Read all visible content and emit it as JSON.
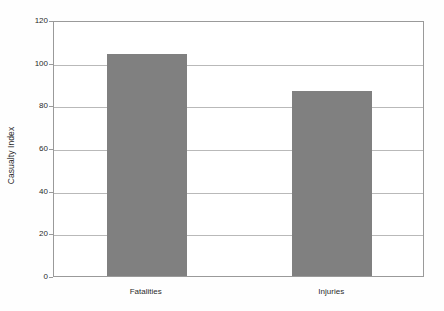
{
  "chart_data": {
    "type": "bar",
    "title": "",
    "subtitle": "",
    "xlabel": "",
    "ylabel": "Casualty Index",
    "categories": [
      "Fatalities",
      "Injuries"
    ],
    "values": [
      104,
      86.5
    ],
    "series": [
      {
        "name": "Casualty Index",
        "values": [
          104,
          86.5
        ]
      }
    ],
    "ylim": [
      0,
      120
    ],
    "yticks": [
      0,
      20,
      40,
      60,
      80,
      100,
      120
    ],
    "ytick_labels": [
      "0",
      "20",
      "40",
      "60",
      "80",
      "100",
      "120"
    ],
    "grid": true,
    "grid_axis": "y",
    "legend": false,
    "legend_position": "none",
    "bar_color": "#808080",
    "grid_color": "#b9b9b9",
    "frame_color": "#9a9a9a",
    "background_color": "#ffffff",
    "text_color": "#2b2b2b"
  }
}
